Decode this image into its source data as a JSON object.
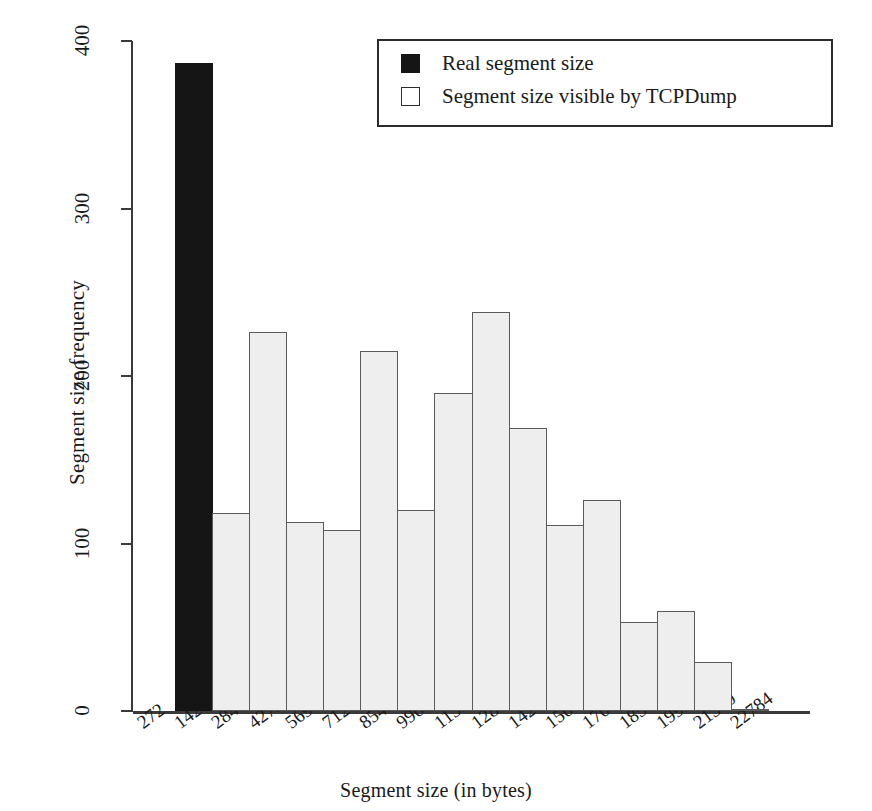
{
  "chart_data": {
    "type": "bar",
    "title": "",
    "xlabel": "Segment size (in bytes)",
    "ylabel": "Segment size frequency",
    "ylim": [
      0,
      400
    ],
    "yticks": [
      0,
      100,
      200,
      300,
      400
    ],
    "grid": false,
    "legend_position": "top-right",
    "categories": [
      "272",
      "1424",
      "2848",
      "4272",
      "5696",
      "7120",
      "8544",
      "9968",
      "11392",
      "12816",
      "14240",
      "15664",
      "17088",
      "18512",
      "19936",
      "21360",
      "22784"
    ],
    "bin_edges": [
      272,
      1424,
      2848,
      4272,
      5696,
      7120,
      8544,
      9968,
      11392,
      12816,
      14240,
      15664,
      17088,
      18512,
      19936,
      21360,
      22784
    ],
    "series": [
      {
        "name": "Real segment size",
        "color": "#151515",
        "bars": [
          {
            "bin_start": "272",
            "bin_end": "1424",
            "value": 387
          }
        ]
      },
      {
        "name": "Segment size visible by TCPDump",
        "color": "#eeeeee",
        "bars": [
          {
            "bin_start": "1424",
            "bin_end": "2848",
            "value": 118
          },
          {
            "bin_start": "2848",
            "bin_end": "4272",
            "value": 226
          },
          {
            "bin_start": "4272",
            "bin_end": "5696",
            "value": 113
          },
          {
            "bin_start": "5696",
            "bin_end": "7120",
            "value": 108
          },
          {
            "bin_start": "7120",
            "bin_end": "8544",
            "value": 215
          },
          {
            "bin_start": "8544",
            "bin_end": "9968",
            "value": 120
          },
          {
            "bin_start": "9968",
            "bin_end": "11392",
            "value": 190
          },
          {
            "bin_start": "11392",
            "bin_end": "12816",
            "value": 238
          },
          {
            "bin_start": "12816",
            "bin_end": "14240",
            "value": 169
          },
          {
            "bin_start": "14240",
            "bin_end": "15664",
            "value": 111
          },
          {
            "bin_start": "15664",
            "bin_end": "17088",
            "value": 126
          },
          {
            "bin_start": "17088",
            "bin_end": "18512",
            "value": 53
          },
          {
            "bin_start": "18512",
            "bin_end": "19936",
            "value": 60
          },
          {
            "bin_start": "19936",
            "bin_end": "21360",
            "value": 29
          },
          {
            "bin_start": "21360",
            "bin_end": "22784",
            "value": 0
          }
        ]
      }
    ],
    "values_in_plot_order": [
      387,
      118,
      226,
      113,
      108,
      215,
      120,
      190,
      238,
      169,
      111,
      126,
      53,
      60,
      29,
      0
    ]
  },
  "legend": {
    "items": [
      {
        "label": "Real segment size",
        "swatch": "real"
      },
      {
        "label": "Segment size visible by TCPDump",
        "swatch": "visible"
      }
    ]
  }
}
